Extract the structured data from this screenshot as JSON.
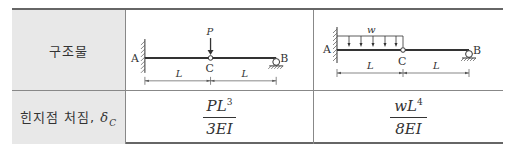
{
  "table": {
    "row_headers": {
      "structure": "구조물",
      "deflection_prefix": "힌지점 처짐, ",
      "deflection_symbol": "δ",
      "deflection_subscript": "C"
    },
    "cases": [
      {
        "diagram": {
          "left_support_label": "A",
          "right_support_label": "B",
          "hinge_label": "C",
          "load_label": "P",
          "load_type": "point",
          "span_labels": [
            "L",
            "L"
          ]
        },
        "deflection": {
          "numerator": "PL",
          "numerator_exp": "3",
          "denominator": "3EI"
        }
      },
      {
        "diagram": {
          "left_support_label": "A",
          "right_support_label": "B",
          "hinge_label": "C",
          "load_label": "w",
          "load_type": "distributed",
          "span_labels": [
            "L",
            "L"
          ]
        },
        "deflection": {
          "numerator": "wL",
          "numerator_exp": "4",
          "denominator": "8EI"
        }
      }
    ]
  }
}
